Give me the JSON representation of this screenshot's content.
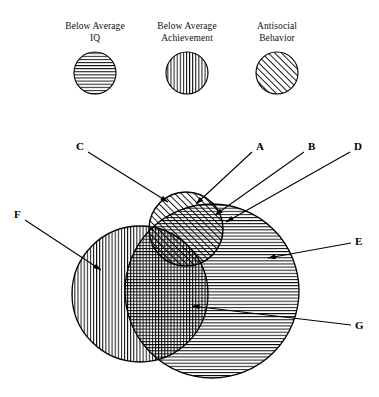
{
  "diagram": {
    "title_present": false,
    "legend": [
      {
        "id": "legend-iq",
        "caption": "Below Average\nIQ",
        "pattern": "horizontal-lines",
        "cx": 95,
        "cy": 73,
        "r": 21
      },
      {
        "id": "legend-achievement",
        "caption": "Below Average\nAchievement",
        "pattern": "vertical-lines",
        "cx": 187,
        "cy": 73,
        "r": 21
      },
      {
        "id": "legend-antisocial",
        "caption": "Antisocial\nBehavior",
        "pattern": "diagonal-lines",
        "cx": 277,
        "cy": 73,
        "r": 21
      }
    ],
    "circles": [
      {
        "id": "circle-achievement",
        "set": "Below Average Achievement",
        "pattern": "vertical-lines",
        "cx": 140,
        "cy": 294,
        "r": 68
      },
      {
        "id": "circle-iq",
        "set": "Below Average IQ",
        "pattern": "horizontal-lines",
        "cx": 212,
        "cy": 291,
        "r": 87
      },
      {
        "id": "circle-antisocial",
        "set": "Antisocial Behavior",
        "pattern": "diagonal-lines",
        "cx": 186,
        "cy": 229,
        "r": 37
      }
    ],
    "labels": [
      {
        "key": "C",
        "text": "C",
        "x": 76,
        "y": 141,
        "tip_x": 168,
        "tip_y": 202,
        "anchor_x": 88,
        "anchor_y": 152
      },
      {
        "key": "A",
        "text": "A",
        "x": 256,
        "y": 141,
        "tip_x": 196,
        "tip_y": 204,
        "anchor_x": 252,
        "anchor_y": 152
      },
      {
        "key": "B",
        "text": "B",
        "x": 308,
        "y": 141,
        "tip_x": 215,
        "tip_y": 215,
        "anchor_x": 304,
        "anchor_y": 152
      },
      {
        "key": "D",
        "text": "D",
        "x": 354,
        "y": 141,
        "tip_x": 226,
        "tip_y": 222,
        "anchor_x": 350,
        "anchor_y": 152
      },
      {
        "key": "F",
        "text": "F",
        "x": 14,
        "y": 209,
        "tip_x": 101,
        "tip_y": 270,
        "anchor_x": 25,
        "anchor_y": 220
      },
      {
        "key": "E",
        "text": "E",
        "x": 355,
        "y": 236,
        "tip_x": 268,
        "tip_y": 258,
        "anchor_x": 351,
        "anchor_y": 243
      },
      {
        "key": "G",
        "text": "G",
        "x": 355,
        "y": 320,
        "tip_x": 192,
        "tip_y": 306,
        "anchor_x": 351,
        "anchor_y": 325
      }
    ],
    "regions": [
      {
        "key": "A",
        "description": "Antisocial Behavior only"
      },
      {
        "key": "B",
        "description": "Antisocial Behavior and Below Average IQ"
      },
      {
        "key": "C",
        "description": "Antisocial Behavior and Below Average Achievement"
      },
      {
        "key": "D",
        "description": "Below Average IQ boundary with Antisocial Behavior"
      },
      {
        "key": "E",
        "description": "Below Average IQ only"
      },
      {
        "key": "F",
        "description": "Below Average Achievement only"
      },
      {
        "key": "G",
        "description": "All three sets overlap"
      }
    ],
    "colors": {
      "stroke": "#000000",
      "fill": "#ffffff",
      "hatch": "#000000"
    }
  }
}
